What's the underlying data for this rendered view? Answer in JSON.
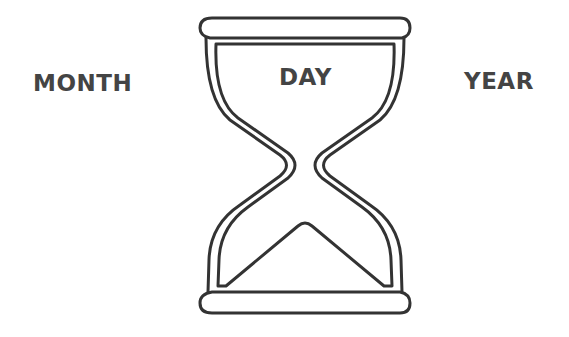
{
  "labels": {
    "month": "MONTH",
    "day": "DAY",
    "year": "YEAR"
  },
  "graphic": {
    "icon": "hourglass-icon",
    "stroke_color": "#333333",
    "text_color": "#444444",
    "background": "#ffffff"
  }
}
